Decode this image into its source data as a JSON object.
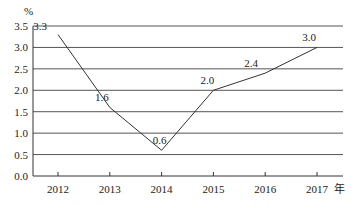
{
  "chart_data": {
    "type": "line",
    "title": "",
    "xlabel": "年",
    "ylabel": "%",
    "categories": [
      "2012",
      "2013",
      "2014",
      "2015",
      "2016",
      "2017"
    ],
    "values": [
      3.3,
      1.6,
      0.6,
      2.0,
      2.4,
      3.0
    ],
    "data_labels": [
      "3.3",
      "1.6",
      "0.6",
      "2.0",
      "2.4",
      "3.0"
    ],
    "ylim": [
      0,
      3.5
    ],
    "yticks": [
      "0.0",
      "0.5",
      "1.0",
      "1.5",
      "2.0",
      "2.5",
      "3.0",
      "3.5"
    ],
    "grid": true,
    "legend": null,
    "colors": {
      "line": "#333333",
      "grid": "#555555",
      "axis": "#333333",
      "text": "#222222"
    }
  }
}
